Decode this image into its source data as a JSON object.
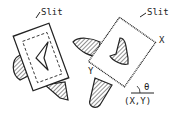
{
  "diagram": {
    "labels": {
      "slit_left": "Slit",
      "slit_right": "Slit",
      "x_axis": "X",
      "y_axis": "Y",
      "angle": "θ",
      "origin": "(X,Y)"
    },
    "colors": {
      "stroke": "#222222",
      "background": "#ffffff"
    }
  }
}
